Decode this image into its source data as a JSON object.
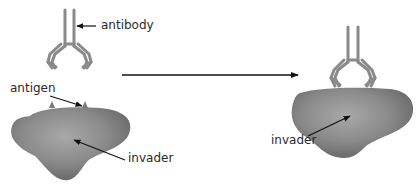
{
  "diagram": {
    "labels": {
      "antibody": "antibody",
      "antigen": "antigen",
      "invader_left": "invader",
      "invader_right": "invader"
    },
    "colors": {
      "antibody": "#8a8a8a",
      "invader_dark": "#6e6e6e",
      "invader_light": "#a8a8a8",
      "arrow": "#111111",
      "text": "#2a2a2a"
    }
  }
}
